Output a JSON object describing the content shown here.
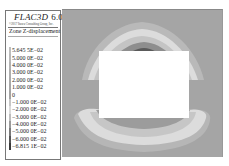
{
  "legend": {
    "title": "FLAC3D",
    "version": "6.00",
    "copyright": "©2017 Itasca Consulting Group, Inc.",
    "subtitle": "Zone Z-displacement",
    "items": [
      {
        "label": "5.645 5E−02",
        "color": "#bdbdbd"
      },
      {
        "label": "5.000 0E−02",
        "color": "#b8b8b8"
      },
      {
        "label": "4.000 0E−02",
        "color": "#b2b2b2"
      },
      {
        "label": "3.000 0E−02",
        "color": "#adadad"
      },
      {
        "label": "2.000 0E−02",
        "color": "#a9a9a9"
      },
      {
        "label": "1.000 0E−02",
        "color": "#a6a6a6"
      },
      {
        "label": "0",
        "color": "#a3a3a3"
      },
      {
        "label": "−1.000 0E−02",
        "color": "#c6c6c6"
      },
      {
        "label": "−2.000 0E−02",
        "color": "#dadada"
      },
      {
        "label": "−3.000 0E−02",
        "color": "#bdbdbd"
      },
      {
        "label": "−4.000 0E−02",
        "color": "#9a9a9a"
      },
      {
        "label": "−5.000 0E−02",
        "color": "#7a7a7a"
      },
      {
        "label": "−6.000 0E−02",
        "color": "#555555"
      },
      {
        "label": "−6.815 1E−02",
        "color": "#3a3a3a"
      }
    ]
  },
  "chart_data": {
    "type": "heatmap",
    "subtitle": "Zone Z-displacement",
    "xlabel": "",
    "ylabel": "",
    "colorbar": {
      "min": -0.068151,
      "max": 0.056455,
      "levels": [
        0.056455,
        0.05,
        0.04,
        0.03,
        0.02,
        0.01,
        0,
        -0.01,
        -0.02,
        -0.03,
        -0.04,
        -0.05,
        -0.06,
        -0.068151
      ],
      "labels": [
        "5.645 5E−02",
        "5.000 0E−02",
        "4.000 0E−02",
        "3.000 0E−02",
        "2.000 0E−02",
        "1.000 0E−02",
        "0",
        "−1.000 0E−02",
        "−2.000 0E−02",
        "−3.000 0E−02",
        "−4.000 0E−02",
        "−5.000 0E−02",
        "−6.000 0E−02",
        "−6.815 1E−02"
      ]
    }
  }
}
